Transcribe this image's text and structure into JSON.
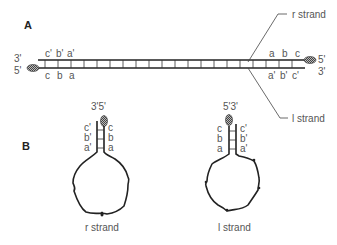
{
  "panels": {
    "a": {
      "label": "A",
      "left_end": {
        "top": "3'",
        "bottom": "5'"
      },
      "right_end": {
        "top": "5'",
        "bottom": "3'"
      },
      "left_top_seq": [
        "c'",
        "b'",
        "a'"
      ],
      "left_bottom_seq": [
        "c",
        "b",
        "a"
      ],
      "right_top_seq": [
        "a",
        "b",
        "c"
      ],
      "right_bottom_seq": [
        "a'",
        "b'",
        "c'"
      ],
      "r_strand_label": "r strand",
      "l_strand_label": "l strand"
    },
    "b": {
      "label": "B",
      "left_hairpin": {
        "ends_label": "3'5'",
        "left_seq": [
          "c'",
          "b'",
          "a'"
        ],
        "right_seq": [
          "c",
          "b",
          "a"
        ],
        "caption": "r strand"
      },
      "right_hairpin": {
        "ends_label": "5'3'",
        "left_seq": [
          "c",
          "b",
          "a"
        ],
        "right_seq": [
          "c'",
          "b'",
          "a'"
        ],
        "caption": "l strand"
      }
    }
  },
  "colors": {
    "line": "#222222",
    "text": "#555555",
    "background": "#ffffff"
  }
}
